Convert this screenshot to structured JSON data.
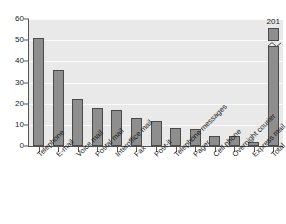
{
  "chart_data": {
    "type": "bar",
    "title": "",
    "xlabel": "",
    "ylabel": "",
    "ylim": [
      0,
      60
    ],
    "ytick_labels": [
      "0",
      "10",
      "20",
      "30",
      "40",
      "50",
      "60"
    ],
    "ytick_values": [
      0,
      10,
      20,
      30,
      40,
      50,
      60
    ],
    "grid": true,
    "legend": "none",
    "orientation": "vertical",
    "categories": [
      "Telephone",
      "E-mail",
      "Voice mail",
      "Postal mail",
      "Interoffice mail",
      "Fax",
      "Post-it",
      "Telephone messages",
      "Pager",
      "Cell phone",
      "Overnight courier",
      "Express mail",
      "Total"
    ],
    "values": [
      51,
      36,
      22,
      18,
      17,
      13,
      12,
      8.5,
      8,
      4.5,
      4.5,
      2,
      201
    ],
    "data_labels": [
      "",
      "",
      "",
      "",
      "",
      "",
      "",
      "",
      "",
      "",
      "",
      "",
      "201"
    ],
    "notes": {
      "broken_bar_category": "Total",
      "broken_bar_label": "201",
      "broken_axis": true
    },
    "colors": {
      "bar_fill": "#8e8e8e",
      "bar_outline": "#4a4a4a",
      "plot_background": "#e9e9e9",
      "gridline": "#fbfbfb",
      "axis": "#555555",
      "text": "#1a1a1a",
      "page_background": "#ffffff"
    }
  }
}
